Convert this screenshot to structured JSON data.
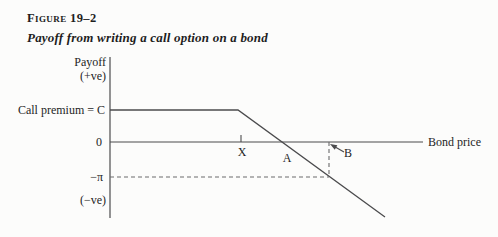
{
  "figure": {
    "label": "Figure 19–2",
    "caption": "Payoff from writing a call option on a bond"
  },
  "colors": {
    "line": "#4b4b4d",
    "dashed_guide": "#6a6a6c",
    "text": "#1e1e1e",
    "background": "#fcfcfb"
  },
  "chart_data": {
    "type": "line",
    "title": "Payoff from writing a call option on a bond",
    "xlabel": "Bond price",
    "ylabel": "Payoff",
    "grid": false,
    "y_axis_labels": {
      "top": "Payoff",
      "top_sign": "(+ve)",
      "premium": "Call premium = C",
      "zero": "0",
      "loss": "−π",
      "bottom_sign": "(−ve)"
    },
    "x_axis_points": [
      {
        "label": "X"
      },
      {
        "label": "A"
      },
      {
        "label": "B"
      }
    ],
    "series": [
      {
        "name": "Payoff from writing a call option",
        "points": [
          {
            "x": "payoff axis",
            "y": "C"
          },
          {
            "x": "X",
            "y": "C"
          },
          {
            "x": "A",
            "y": "0"
          },
          {
            "x": "B",
            "y": "−π"
          },
          {
            "x": "beyond B",
            "y": "below −π"
          }
        ]
      }
    ],
    "guides": [
      {
        "type": "dashed-horizontal",
        "at_y": "−π",
        "from_x": "payoff axis",
        "to_x": "B"
      },
      {
        "type": "dashed-vertical",
        "at_x": "B",
        "from_y": "0",
        "to_y": "−π"
      },
      {
        "type": "arrow",
        "label": "B",
        "points_to": "bond price B on x-axis"
      }
    ],
    "geometry": {
      "canvas": {
        "width": 498,
        "height": 237
      },
      "y_axis": {
        "x": 110,
        "y1": 57,
        "y2": 218
      },
      "x_axis": {
        "y": 142,
        "x1": 110,
        "x2": 423
      },
      "strike_tick": {
        "x": 241,
        "y1": 135,
        "y2": 142
      },
      "payoff_polyline": [
        [
          110,
          110
        ],
        [
          238,
          110
        ],
        [
          385,
          217
        ]
      ],
      "dash_h": {
        "x1": 110,
        "y1": 177,
        "x2": 329,
        "y2": 177
      },
      "dash_v": {
        "x1": 329,
        "y1": 142,
        "x2": 329,
        "y2": 177
      },
      "arrow": {
        "tip": [
          330,
          144
        ],
        "tail": [
          344,
          152
        ]
      }
    }
  }
}
